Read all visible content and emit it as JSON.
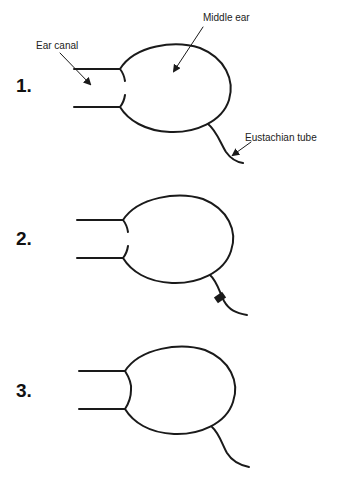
{
  "figure": {
    "stroke_color": "#1a1a1a",
    "background": "#ffffff"
  },
  "labels": {
    "middle_ear": "Middle ear",
    "ear_canal": "Ear canal",
    "eustachian_tube": "Eustachian tube"
  },
  "panels": [
    {
      "number": "1.",
      "state": "eardrum open (gap), tube open"
    },
    {
      "number": "2.",
      "state": "eardrum open (gap), tube blocked"
    },
    {
      "number": "3.",
      "state": "eardrum intact, tube open"
    }
  ]
}
